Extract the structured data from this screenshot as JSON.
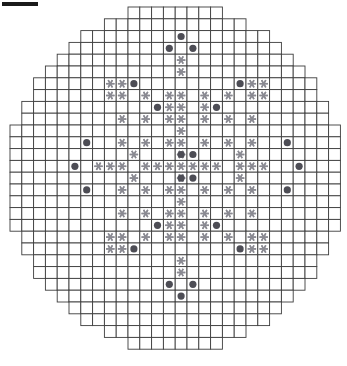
{
  "page": {
    "background_color": "#ffffff"
  },
  "top_rule": {
    "name": "top-left-rule",
    "color": "#1a1a1a",
    "x": 2,
    "y": 2,
    "width": 36,
    "height": 4
  },
  "grid": {
    "origin_x": 10,
    "origin_y": 7,
    "cell_size": 11.8,
    "columns": 28,
    "rows": 29,
    "line_color": "#3c3c3c",
    "line_width": 0.9,
    "cell_fill": "#ffffff",
    "row_spans": [
      [
        10,
        18
      ],
      [
        8,
        20
      ],
      [
        6,
        22
      ],
      [
        5,
        23
      ],
      [
        4,
        24
      ],
      [
        3,
        25
      ],
      [
        2,
        26
      ],
      [
        2,
        26
      ],
      [
        1,
        27
      ],
      [
        1,
        27
      ],
      [
        0,
        28
      ],
      [
        0,
        28
      ],
      [
        0,
        28
      ],
      [
        0,
        28
      ],
      [
        0,
        28
      ],
      [
        0,
        28
      ],
      [
        0,
        28
      ],
      [
        0,
        28
      ],
      [
        0,
        28
      ],
      [
        1,
        27
      ],
      [
        1,
        27
      ],
      [
        2,
        26
      ],
      [
        2,
        26
      ],
      [
        3,
        25
      ],
      [
        4,
        24
      ],
      [
        5,
        23
      ],
      [
        6,
        22
      ],
      [
        8,
        20
      ],
      [
        10,
        18
      ]
    ]
  },
  "markers": {
    "dot": {
      "name": "control-rod-position",
      "color": "#4d4d55",
      "radius": 3.6,
      "count": 28,
      "positions": [
        [
          14,
          2
        ],
        [
          13,
          3
        ],
        [
          15,
          3
        ],
        [
          10,
          6
        ],
        [
          19,
          6
        ],
        [
          12,
          8
        ],
        [
          17,
          8
        ],
        [
          6,
          11
        ],
        [
          23,
          11
        ],
        [
          14,
          12
        ],
        [
          15,
          12
        ],
        [
          5,
          13
        ],
        [
          24,
          13
        ],
        [
          14,
          14
        ],
        [
          15,
          14
        ],
        [
          6,
          15
        ],
        [
          23,
          15
        ],
        [
          12,
          18
        ],
        [
          17,
          18
        ],
        [
          10,
          20
        ],
        [
          19,
          20
        ],
        [
          13,
          23
        ],
        [
          15,
          23
        ],
        [
          14,
          24
        ]
      ]
    },
    "star": {
      "name": "instrument-thimble-position",
      "color": "#8a8a92",
      "radius": 4.2,
      "points": 6,
      "count": 96,
      "positions": [
        [
          14,
          4
        ],
        [
          14,
          5
        ],
        [
          8,
          6
        ],
        [
          9,
          6
        ],
        [
          20,
          6
        ],
        [
          21,
          6
        ],
        [
          8,
          7
        ],
        [
          9,
          7
        ],
        [
          11,
          7
        ],
        [
          13,
          7
        ],
        [
          14,
          7
        ],
        [
          16,
          7
        ],
        [
          18,
          7
        ],
        [
          20,
          7
        ],
        [
          21,
          7
        ],
        [
          13,
          8
        ],
        [
          16,
          8
        ],
        [
          14,
          8
        ],
        [
          9,
          9
        ],
        [
          11,
          9
        ],
        [
          13,
          9
        ],
        [
          14,
          9
        ],
        [
          16,
          9
        ],
        [
          18,
          9
        ],
        [
          20,
          9
        ],
        [
          14,
          10
        ],
        [
          9,
          11
        ],
        [
          11,
          11
        ],
        [
          13,
          11
        ],
        [
          14,
          11
        ],
        [
          16,
          11
        ],
        [
          18,
          11
        ],
        [
          20,
          11
        ],
        [
          10,
          12
        ],
        [
          19,
          12
        ],
        [
          14,
          12
        ],
        [
          7,
          13
        ],
        [
          8,
          13
        ],
        [
          9,
          13
        ],
        [
          11,
          13
        ],
        [
          12,
          13
        ],
        [
          13,
          13
        ],
        [
          14,
          13
        ],
        [
          15,
          13
        ],
        [
          16,
          13
        ],
        [
          17,
          13
        ],
        [
          19,
          13
        ],
        [
          20,
          13
        ],
        [
          21,
          13
        ],
        [
          10,
          14
        ],
        [
          19,
          14
        ],
        [
          14,
          14
        ],
        [
          9,
          15
        ],
        [
          11,
          15
        ],
        [
          13,
          15
        ],
        [
          14,
          15
        ],
        [
          16,
          15
        ],
        [
          18,
          15
        ],
        [
          20,
          15
        ],
        [
          14,
          16
        ],
        [
          9,
          17
        ],
        [
          11,
          17
        ],
        [
          13,
          17
        ],
        [
          14,
          17
        ],
        [
          16,
          17
        ],
        [
          18,
          17
        ],
        [
          20,
          17
        ],
        [
          13,
          18
        ],
        [
          16,
          18
        ],
        [
          14,
          18
        ],
        [
          8,
          19
        ],
        [
          9,
          19
        ],
        [
          11,
          19
        ],
        [
          13,
          19
        ],
        [
          14,
          19
        ],
        [
          16,
          19
        ],
        [
          18,
          19
        ],
        [
          20,
          19
        ],
        [
          21,
          19
        ],
        [
          8,
          20
        ],
        [
          9,
          20
        ],
        [
          20,
          20
        ],
        [
          21,
          20
        ],
        [
          14,
          21
        ],
        [
          14,
          22
        ]
      ]
    }
  },
  "legend": {
    "dot_label": "control rod",
    "star_label": "instrument thimble"
  }
}
